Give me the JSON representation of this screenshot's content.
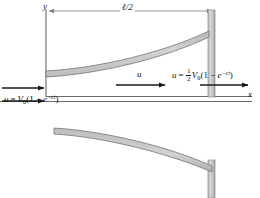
{
  "figure": {
    "background_color": "#ffffff",
    "band_fill_color": "#c9c9c9",
    "band_edge_color": "#6e6e6e",
    "wall_fill_color": "#c9c9c9",
    "axis_color": "#6b6b6b",
    "arrow_color": "#1a1a1a",
    "text_color": "#111111"
  },
  "axes": {
    "y_label": "y",
    "x_label": "x"
  },
  "dimension": {
    "label": "ℓ/2"
  },
  "flow": {
    "mid_arrow_label": "u",
    "inlet_equation": {
      "lhs": "u",
      "equals": "=",
      "V": "V",
      "V_sub": "0",
      "open": "(1 − ",
      "e": "e",
      "exp": "−ct",
      "close": ")"
    },
    "outlet_equation": {
      "lhs": "u",
      "equals": "=",
      "frac_num": "1",
      "frac_den": "2",
      "V": "V",
      "V_sub": "0",
      "open": "(1 − ",
      "e": "e",
      "exp": "−ct",
      "close": ")"
    }
  },
  "arrows": {
    "inlet_arrow": "inlet-flow-arrow",
    "mid_arrow": "mid-flow-arrow",
    "outlet_arrow": "outlet-flow-arrow",
    "dimension_arrow": "length-dimension-arrow"
  }
}
